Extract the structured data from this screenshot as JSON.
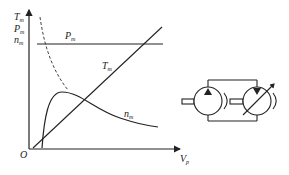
{
  "figure": {
    "y_axis_labels": [
      "T",
      "P",
      "n"
    ],
    "y_axis_subscripts": [
      "m",
      "m",
      "m"
    ],
    "x_axis_label": "V",
    "x_axis_subscript": "p",
    "origin_label": "O",
    "curves": {
      "power": {
        "label": "P",
        "sub": "m",
        "style": "horizontal line"
      },
      "torque": {
        "label": "T",
        "sub": "m",
        "style": "straight rising line"
      },
      "speed": {
        "label": "n",
        "sub": "m",
        "style": "rise-then-decay curve"
      },
      "speed_dashed": {
        "style": "dashed hyperbolic curve"
      }
    },
    "schematic": {
      "pump": "fixed displacement pump",
      "motor": "variable displacement motor"
    }
  }
}
